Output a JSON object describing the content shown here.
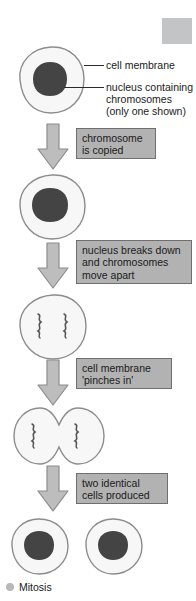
{
  "diagram": {
    "title": "Mitosis",
    "colors": {
      "cell_fill": "#f7f7f7",
      "cell_stroke": "#8c8c8c",
      "nucleus_fill": "#444444",
      "arrow_fill": "#bdbdbd",
      "arrow_stroke": "#8c8c8c",
      "caption_bg": "#b2b2b2",
      "caption_border": "#6f6f6f",
      "text": "#1a1a1a",
      "placeholder": "#c2c4c6",
      "bullet": "#b8b8b8"
    },
    "labels": [
      {
        "id": "cell-membrane",
        "text": "cell membrane"
      },
      {
        "id": "nucleus",
        "line1": "nucleus containing",
        "line2": "chromosomes",
        "line3": "(only one shown)"
      }
    ],
    "captions": [
      {
        "id": "chromosome-copied",
        "line1": "chromosome",
        "line2": "is copied"
      },
      {
        "id": "nucleus-breaks-down",
        "line1": "nucleus breaks down",
        "line2": "and chromosomes",
        "line3": "move apart"
      },
      {
        "id": "membrane-pinches",
        "line1": "cell membrane",
        "line2": "'pinches in'"
      },
      {
        "id": "two-cells",
        "line1": "two identical",
        "line2": "cells produced"
      }
    ],
    "stages": [
      {
        "id": "stage-1-cell-with-nucleus",
        "name": "cell with nucleus"
      },
      {
        "id": "stage-2-cell-copied",
        "name": "cell with copied chromosome"
      },
      {
        "id": "stage-3-chromosomes-apart",
        "name": "cell with two chromosomes"
      },
      {
        "id": "stage-4-pinched-cell",
        "name": "pinching cell"
      },
      {
        "id": "stage-5-daughter-cells",
        "name": "two daughter cells"
      }
    ]
  }
}
